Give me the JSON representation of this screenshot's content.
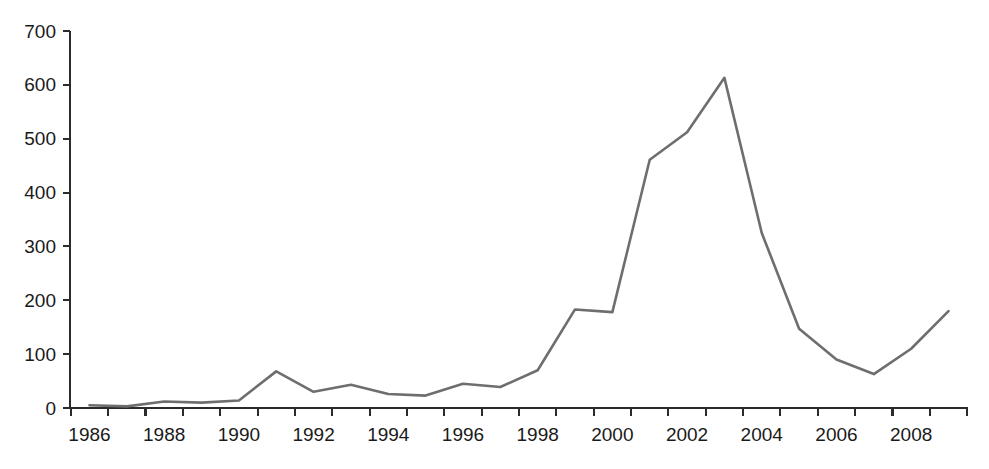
{
  "chart_data": {
    "type": "line",
    "title": "",
    "subtitle": "",
    "xlabel": "",
    "ylabel": "",
    "xlim": [
      1986,
      2009
    ],
    "ylim": [
      0,
      700
    ],
    "grid": false,
    "legend": null,
    "legend_position": "none",
    "line_color": "#6e6e6e",
    "axis_color": "#2b2b2b",
    "background_color": "#ffffff",
    "y_ticks": [
      0,
      100,
      200,
      300,
      400,
      500,
      600,
      700
    ],
    "y_tick_labels": [
      "0",
      "100",
      "200",
      "300",
      "400",
      "500",
      "600",
      "700"
    ],
    "x_ticks": [
      1986,
      1987,
      1988,
      1989,
      1990,
      1991,
      1992,
      1993,
      1994,
      1995,
      1996,
      1997,
      1998,
      1999,
      2000,
      2001,
      2002,
      2003,
      2004,
      2005,
      2006,
      2007,
      2008,
      2009
    ],
    "x_tick_labels_shown": [
      "1986",
      "1988",
      "1990",
      "1992",
      "1994",
      "1996",
      "1998",
      "2000",
      "2002",
      "2004",
      "2006",
      "2008"
    ],
    "x_label_interval": 2,
    "x": [
      1986,
      1987,
      1988,
      1989,
      1990,
      1991,
      1992,
      1993,
      1994,
      1995,
      1996,
      1997,
      1998,
      1999,
      2000,
      2001,
      2002,
      2003,
      2004,
      2005,
      2006,
      2007,
      2008,
      2009
    ],
    "categories": [
      "1986",
      "1987",
      "1988",
      "1989",
      "1990",
      "1991",
      "1992",
      "1993",
      "1994",
      "1995",
      "1996",
      "1997",
      "1998",
      "1999",
      "2000",
      "2001",
      "2002",
      "2003",
      "2004",
      "2005",
      "2006",
      "2007",
      "2008",
      "2009"
    ],
    "values": [
      5,
      3,
      12,
      10,
      14,
      68,
      30,
      43,
      26,
      23,
      45,
      39,
      70,
      183,
      178,
      461,
      512,
      613,
      325,
      147,
      90,
      63,
      110,
      180
    ],
    "series": [
      {
        "name": "series-1",
        "values": [
          5,
          3,
          12,
          10,
          14,
          68,
          30,
          43,
          26,
          23,
          45,
          39,
          70,
          183,
          178,
          461,
          512,
          613,
          325,
          147,
          90,
          63,
          110,
          180
        ]
      }
    ]
  }
}
